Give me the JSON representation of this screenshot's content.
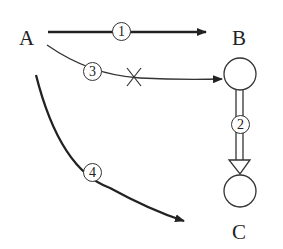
{
  "nodes": {
    "A": {
      "label": "A"
    },
    "B": {
      "label": "B"
    },
    "C": {
      "label": "C"
    }
  },
  "arrows": [
    {
      "id": "1",
      "label": "1",
      "from": "A",
      "to": "B",
      "style": "solid"
    },
    {
      "id": "2",
      "label": "2",
      "from": "B",
      "to": "C",
      "style": "double-hollow"
    },
    {
      "id": "3",
      "label": "3",
      "from": "A",
      "to": "B-circle",
      "style": "curved-blocked",
      "mark": "×"
    },
    {
      "id": "4",
      "label": "4",
      "from": "A",
      "to": "C",
      "style": "curved-thick"
    }
  ]
}
